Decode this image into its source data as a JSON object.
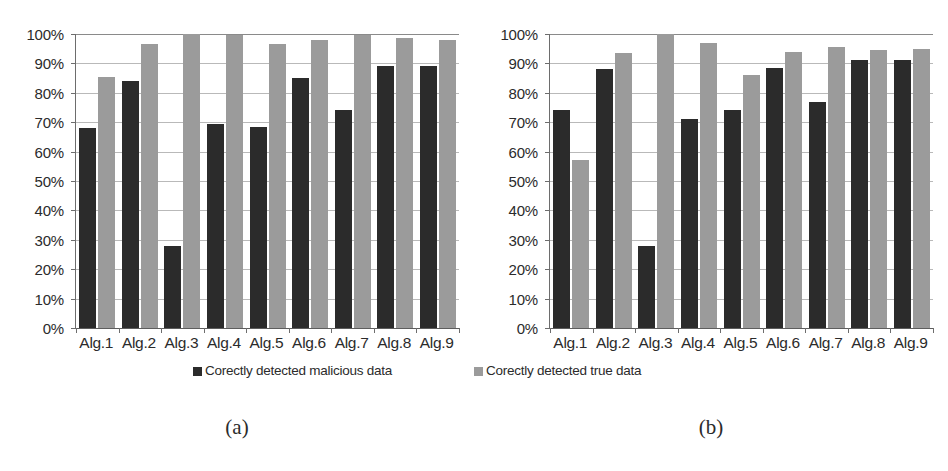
{
  "figure": {
    "panels": [
      {
        "caption": "(a)"
      },
      {
        "caption": "(b)"
      }
    ],
    "legend": [
      {
        "label": "Corectly detected malicious data",
        "color": "#2b2b2b",
        "key": "malicious"
      },
      {
        "label": "Corectly detected true data",
        "color": "#9b9b9b",
        "key": "true"
      }
    ]
  },
  "chart_data": [
    {
      "type": "bar",
      "panel": "(a)",
      "title": "",
      "xlabel": "",
      "ylabel": "",
      "ylim": [
        0,
        100
      ],
      "ytick_labels": [
        "100%",
        "90%",
        "80%",
        "70%",
        "60%",
        "50%",
        "40%",
        "30%",
        "20%",
        "10%",
        "0%"
      ],
      "ytick_values": [
        100,
        90,
        80,
        70,
        60,
        50,
        40,
        30,
        20,
        10,
        0
      ],
      "grid": true,
      "legend_position": "bottom",
      "categories": [
        "Alg.1",
        "Alg.2",
        "Alg.3",
        "Alg.4",
        "Alg.5",
        "Alg.6",
        "Alg.7",
        "Alg.8",
        "Alg.9"
      ],
      "series": [
        {
          "name": "Corectly detected malicious data",
          "color": "#2b2b2b",
          "values": [
            68,
            84,
            28,
            69.5,
            68.5,
            85,
            74,
            89,
            89
          ]
        },
        {
          "name": "Corectly detected true data",
          "color": "#9b9b9b",
          "values": [
            85.5,
            96.5,
            100,
            99.5,
            96.5,
            98,
            99.5,
            98.5,
            98
          ]
        }
      ]
    },
    {
      "type": "bar",
      "panel": "(b)",
      "title": "",
      "xlabel": "",
      "ylabel": "",
      "ylim": [
        0,
        100
      ],
      "ytick_labels": [
        "100%",
        "90%",
        "80%",
        "70%",
        "60%",
        "50%",
        "40%",
        "30%",
        "20%",
        "10%",
        "0%"
      ],
      "ytick_values": [
        100,
        90,
        80,
        70,
        60,
        50,
        40,
        30,
        20,
        10,
        0
      ],
      "grid": true,
      "legend_position": "bottom",
      "categories": [
        "Alg.1",
        "Alg.2",
        "Alg.3",
        "Alg.4",
        "Alg.5",
        "Alg.6",
        "Alg.7",
        "Alg.8",
        "Alg.9"
      ],
      "series": [
        {
          "name": "Corectly detected malicious data",
          "color": "#2b2b2b",
          "values": [
            74,
            88,
            28,
            71,
            74,
            88.5,
            77,
            91,
            91
          ]
        },
        {
          "name": "Corectly detected true data",
          "color": "#9b9b9b",
          "values": [
            57,
            93.5,
            100,
            97,
            86,
            94,
            95.5,
            94.5,
            95
          ]
        }
      ]
    }
  ]
}
